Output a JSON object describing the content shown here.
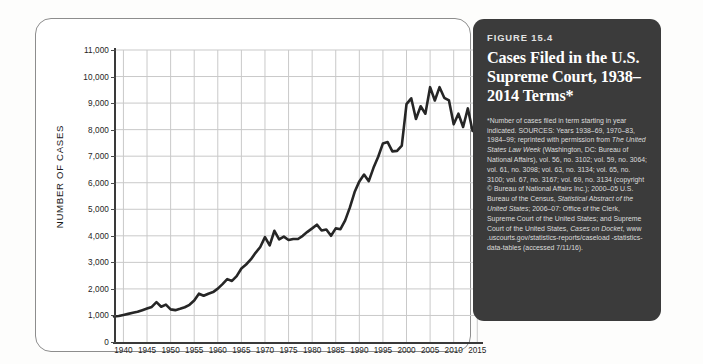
{
  "figure": {
    "number": "FIGURE 15.4",
    "title": "Cases Filed in the U.S. Supreme Court, 1938–2014 Terms*",
    "footnote_note": "*Number of cases filed in term starting in year indicated.",
    "footnote_sources_label": "SOURCES:",
    "footnote_sources_part1": " Years 1938–69, 1970–83, 1984–99; reprinted with permission from ",
    "footnote_sources_italic1": "The United States Law Week",
    "footnote_sources_part2": " (Washington, DC: Bureau of National Affairs), vol. 56, no. 3102; vol. 59, no. 3064; vol. 61, no. 3098; vol. 63, no. 3134; vol. 65, no. 3100; vol. 67, no. 3167; vol. 69, no. 3134 (copyright © Bureau of National Affairs Inc.); 2000–05 U.S. Bureau of the Census, ",
    "footnote_sources_italic2": "Statistical Abstract of the United States",
    "footnote_sources_part3": "; 2006–07: Office of the Clerk, Supreme Court of the United States; and Supreme Court of the United States, ",
    "footnote_sources_italic3": "Cases on Docket",
    "footnote_sources_part4": ", www .uscourts.gov/statistics-reports/caseload -statistics-data-tables (accessed 7/11/16)."
  },
  "colors": {
    "panel_background": "#3b3b3b",
    "series_line": "#262626",
    "grid": "#c9c9c9",
    "axis": "#3a3a3a",
    "card_border": "#8d8d8d"
  },
  "chart_data": {
    "type": "line",
    "title": "Cases Filed in the U.S. Supreme Court, 1938–2014 Terms",
    "xlabel": "",
    "ylabel": "NUMBER OF CASES",
    "xlim": [
      1938,
      2016
    ],
    "ylim": [
      0,
      11000
    ],
    "grid": true,
    "legend": "none",
    "y_ticks": [
      0,
      1000,
      2000,
      3000,
      4000,
      5000,
      6000,
      7000,
      8000,
      9000,
      10000,
      11000
    ],
    "y_tick_labels": [
      "0",
      "1,000",
      "2,000",
      "3,000",
      "4,000",
      "5,000",
      "6,000",
      "7,000",
      "8,000",
      "9,000",
      "10,000",
      "11,000"
    ],
    "x_ticks": [
      1940,
      1945,
      1950,
      1955,
      1960,
      1965,
      1970,
      1975,
      1980,
      1985,
      1990,
      1995,
      2000,
      2005,
      2010,
      2015
    ],
    "x_tick_labels": [
      "1940",
      "1945",
      "1950",
      "1955",
      "1960",
      "1965",
      "1970",
      "1975",
      "1980",
      "1985",
      "1990",
      "1995",
      "2000",
      "2005",
      "2010",
      "2015"
    ],
    "x_minor_step": 5,
    "series": [
      {
        "name": "Cases filed",
        "x": [
          1938,
          1939,
          1940,
          1941,
          1942,
          1943,
          1944,
          1945,
          1946,
          1947,
          1948,
          1949,
          1950,
          1951,
          1952,
          1953,
          1954,
          1955,
          1956,
          1957,
          1958,
          1959,
          1960,
          1961,
          1962,
          1963,
          1964,
          1965,
          1966,
          1967,
          1968,
          1969,
          1970,
          1971,
          1972,
          1973,
          1974,
          1975,
          1976,
          1977,
          1978,
          1979,
          1980,
          1981,
          1982,
          1983,
          1984,
          1985,
          1986,
          1987,
          1988,
          1989,
          1990,
          1991,
          1992,
          1993,
          1994,
          1995,
          1996,
          1997,
          1998,
          1999,
          2000,
          2001,
          2002,
          2003,
          2004,
          2005,
          2006,
          2007,
          2008,
          2009,
          2010,
          2011,
          2012,
          2013,
          2014
        ],
        "y": [
          960,
          980,
          1020,
          1060,
          1100,
          1140,
          1200,
          1260,
          1320,
          1500,
          1330,
          1410,
          1230,
          1200,
          1250,
          1310,
          1400,
          1560,
          1820,
          1740,
          1820,
          1880,
          2010,
          2180,
          2370,
          2300,
          2480,
          2770,
          2920,
          3110,
          3360,
          3580,
          3950,
          3640,
          4190,
          3870,
          3970,
          3840,
          3880,
          3880,
          4000,
          4150,
          4280,
          4420,
          4200,
          4240,
          4000,
          4280,
          4250,
          4580,
          5070,
          5650,
          6050,
          6310,
          6060,
          6560,
          6980,
          7480,
          7530,
          7180,
          7200,
          7400,
          8960,
          9180,
          8400,
          8880,
          8600,
          9600,
          9100,
          9600,
          9200,
          9100,
          8200,
          8600,
          8100,
          8800,
          7950
        ],
        "units": "cases"
      }
    ]
  }
}
